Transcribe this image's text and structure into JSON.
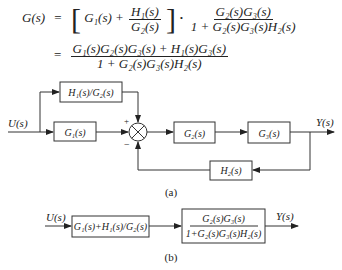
{
  "equation": {
    "lhs": "G(s)",
    "line1": {
      "eq": "=",
      "bracket_term": "G₁(s) +",
      "frac1_num": "H₁(s)",
      "frac1_den": "G₂(s)",
      "dot": "·",
      "frac2_num": "G₂(s)G₃(s)",
      "frac2_den": "1 + G₂(s)G₃(s)H₂(s)"
    },
    "line2": {
      "eq": "=",
      "frac_num": "G₁(s)G₂(s)G₃(s) + H₁(s)G₃(s)",
      "frac_den": "1 + G₂(s)G₃(s)H₂(s)"
    }
  },
  "diagram_a": {
    "input_label": "U(s)",
    "output_label": "Y(s)",
    "blocks": {
      "h1_over_g2": "H₁(s)/G₂(s)",
      "g1": "G₁(s)",
      "g2": "G₂(s)",
      "g3": "G₃(s)",
      "h2": "H₂(s)"
    },
    "sum_signs": {
      "top": "+",
      "bottom": "−"
    },
    "caption": "(a)"
  },
  "diagram_b": {
    "input_label": "U(s)",
    "output_label": "Y(s)",
    "block1": "G₁(s)+H₁(s)/G₂(s)",
    "block2_num": "G₂(s)G₃(s)",
    "block2_den": "1+G₂(s)G₃(s)H₂(s)",
    "caption": "(b)"
  }
}
